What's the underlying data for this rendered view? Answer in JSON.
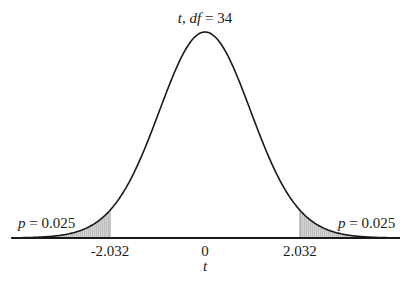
{
  "chart_data": {
    "type": "area",
    "distribution": "t",
    "df": 34,
    "title": "t, df = 34",
    "title_parts": {
      "var": "t",
      "sep": ", ",
      "df_label": "df",
      "eq": " = ",
      "df_value": "34"
    },
    "xlabel": "t",
    "ylabel": "",
    "x_ticks": [
      {
        "value": -2.032,
        "label": "-2.032"
      },
      {
        "value": 0,
        "label": "0"
      },
      {
        "value": 2.032,
        "label": "2.032"
      }
    ],
    "critical_values": [
      -2.032,
      2.032
    ],
    "shaded_regions": [
      {
        "from": -4.15,
        "to": -2.032,
        "p": 0.025
      },
      {
        "from": 2.032,
        "to": 4.15,
        "p": 0.025
      }
    ],
    "annotations": [
      {
        "side": "left",
        "var": "p",
        "text": " = 0.025"
      },
      {
        "side": "right",
        "var": "p",
        "text": " = 0.025"
      }
    ],
    "xlim": [
      -4.15,
      4.15
    ],
    "grid": false,
    "legend": "none"
  },
  "style": {
    "curve_color": "#1a1a1a",
    "shade_color": "#d4d4d4",
    "hatch_color": "#9a9a9a",
    "axis_color": "#1a1a1a"
  }
}
